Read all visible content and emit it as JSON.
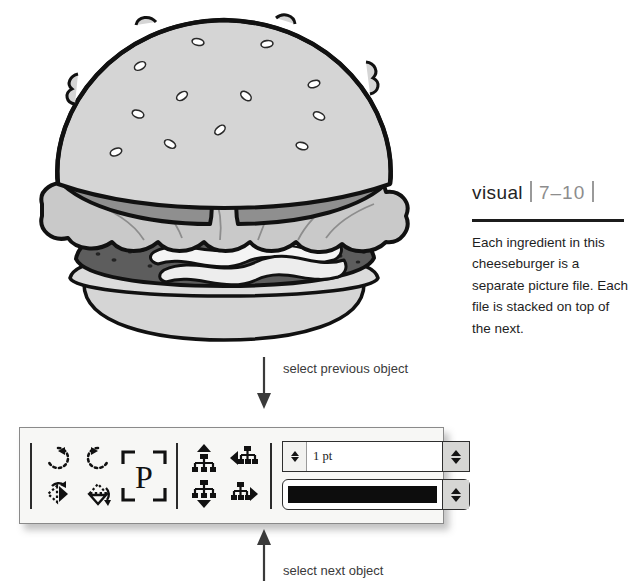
{
  "illustration": {
    "name": "cheeseburger-illustration",
    "alt": "Stacked cheeseburger with sesame seed bun, lettuce, tomato, bacon and patty",
    "layers": [
      "top bun with sesame seeds",
      "tomato slices",
      "lettuce",
      "bacon",
      "patty",
      "bottom bun"
    ],
    "colors": {
      "bun": "#d5d5d5",
      "bun_shadow": "#bdbdbd",
      "tomato": "#8f8f8f",
      "lettuce": "#c9c9c9",
      "patty": "#5d5d5d",
      "bacon": "#f2f2f2",
      "outline": "#111111",
      "seed": "#ffffff"
    }
  },
  "caption": {
    "visual_word": "visual",
    "figure_number": "7–10",
    "body": "Each ingredient in this cheeseburger is a separate picture file. Each file is stacked on top of the next."
  },
  "annotations": {
    "previous": "select previous object",
    "next": "select next object"
  },
  "toolbar": {
    "transform_buttons": [
      {
        "name": "rotate-clockwise-button",
        "label": "Rotate Clockwise"
      },
      {
        "name": "rotate-counterclockwise-button",
        "label": "Rotate Counterclockwise"
      },
      {
        "name": "flip-horizontal-button",
        "label": "Flip Horizontal"
      },
      {
        "name": "flip-vertical-button",
        "label": "Flip Vertical"
      }
    ],
    "placeholder_button": {
      "name": "placeholder-frame-button",
      "label": "P"
    },
    "arrange_buttons": [
      {
        "name": "bring-to-front-button",
        "label": "Bring to Front"
      },
      {
        "name": "send-backward-button",
        "label": "Send Backward"
      },
      {
        "name": "send-to-back-button",
        "label": "Send to Back"
      },
      {
        "name": "bring-forward-button",
        "label": "Bring Forward"
      }
    ],
    "stroke_weight": {
      "label": "Stroke Weight",
      "value": "1 pt"
    },
    "stroke_color": {
      "label": "Stroke Color",
      "value": "#0d0d0d"
    }
  }
}
